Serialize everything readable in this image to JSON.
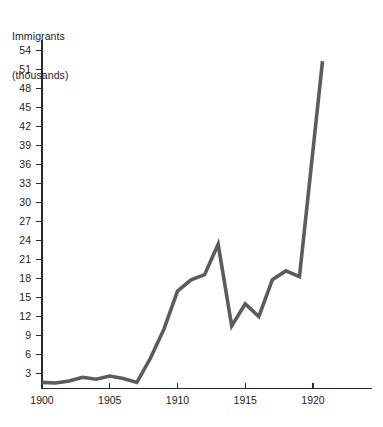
{
  "chart_data": {
    "type": "line",
    "title": "",
    "ylabel_lines": [
      "Immigrants",
      "(thousands)"
    ],
    "ylabel": "Immigrants (thousands)",
    "xlabel": "",
    "xlim": [
      1899.4,
      1922.5
    ],
    "ylim": [
      0,
      55.5
    ],
    "grid": false,
    "legend": "none",
    "line_color": "#5c5c5c",
    "axis_color": "#2b2b2b",
    "background": "#ffffff",
    "ytick_values": [
      3,
      6,
      9,
      12,
      15,
      18,
      21,
      24,
      27,
      30,
      33,
      36,
      39,
      42,
      45,
      48,
      51,
      54
    ],
    "ytick_labels": [
      "3",
      "6",
      "9",
      "12",
      "15",
      "18",
      "21",
      "24",
      "27",
      "30",
      "33",
      "36",
      "39",
      "42",
      "45",
      "48",
      "51",
      "54"
    ],
    "xtick_values": [
      1900,
      1905,
      1910,
      1915,
      1920
    ],
    "xtick_labels": [
      "1900",
      "1905",
      "1910",
      "1915",
      "1920"
    ],
    "x": [
      1900,
      1901,
      1902,
      1903,
      1904,
      1905,
      1906,
      1907,
      1908,
      1909,
      1910,
      1911,
      1912,
      1913,
      1914,
      1915,
      1916,
      1917,
      1918,
      1919,
      1920.7
    ],
    "values": [
      1.6,
      1.5,
      1.8,
      2.4,
      2.1,
      2.6,
      2.2,
      1.6,
      5.4,
      10.0,
      16.0,
      17.8,
      18.6,
      23.4,
      10.5,
      14.0,
      12.0,
      17.8,
      19.2,
      18.3,
      52.3
    ],
    "series": [
      {
        "name": "Immigrants",
        "values": [
          1.6,
          1.5,
          1.8,
          2.4,
          2.1,
          2.6,
          2.2,
          1.6,
          5.4,
          10.0,
          16.0,
          17.8,
          18.6,
          23.4,
          10.5,
          14.0,
          12.0,
          17.8,
          19.2,
          18.3,
          52.3
        ]
      }
    ],
    "annotations": []
  }
}
